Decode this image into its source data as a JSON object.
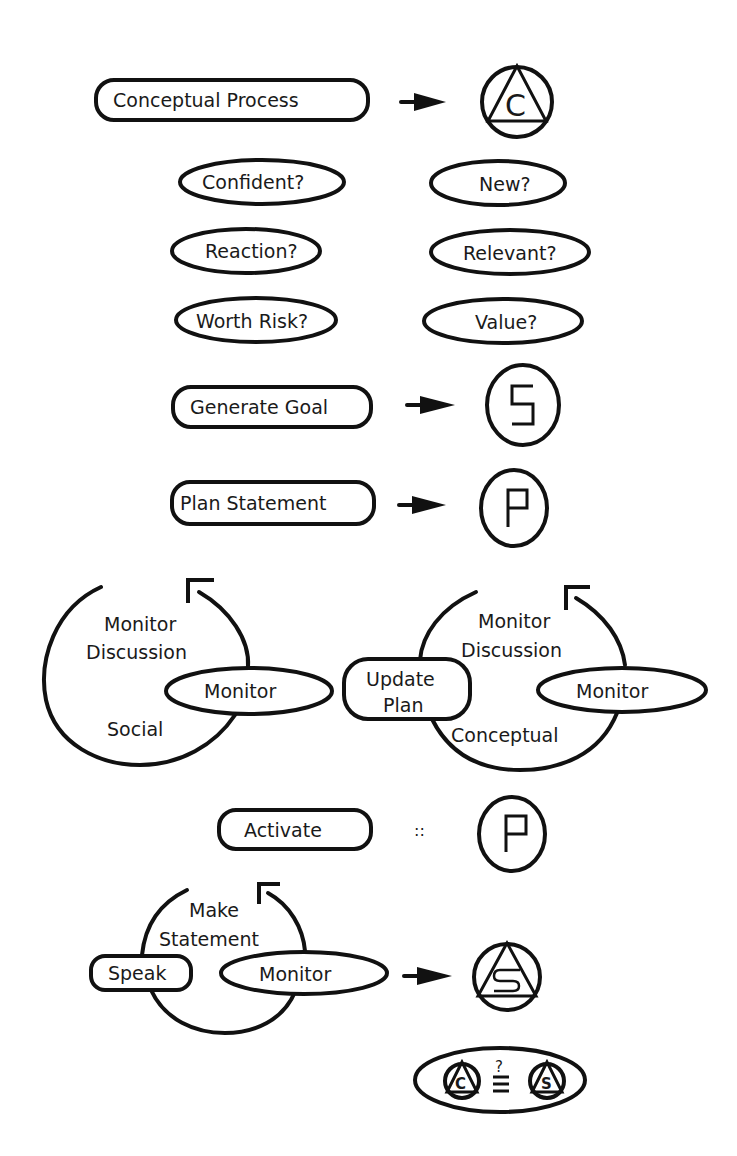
{
  "diagram": {
    "rows": {
      "conceptual_process": {
        "label": "Conceptual Process",
        "symbol": "C"
      },
      "questions_left": [
        "Confident?",
        "Reaction?",
        "Worth Risk?"
      ],
      "questions_right": [
        "New?",
        "Relevant?",
        "Value?"
      ],
      "generate_goal": {
        "label": "Generate Goal",
        "symbol": "S"
      },
      "plan_statement": {
        "label": "Plan Statement",
        "symbol": "P"
      },
      "social_loop": {
        "title_line1": "Monitor",
        "title_line2": "Discussion",
        "node": "Monitor",
        "type": "Social"
      },
      "conceptual_loop": {
        "title_line1": "Monitor",
        "title_line2": "Discussion",
        "node": "Monitor",
        "side_node_line1": "Update",
        "side_node_line2": "Plan",
        "type": "Conceptual"
      },
      "activate": {
        "label": "Activate",
        "relation": "::",
        "symbol": "P"
      },
      "statement_loop": {
        "title_line1": "Make",
        "title_line2": "Statement",
        "side_node": "Speak",
        "node": "Monitor",
        "symbol": "S"
      },
      "comparison": {
        "operator_top": "?",
        "left_symbol": "C",
        "right_symbol": "S"
      }
    }
  }
}
